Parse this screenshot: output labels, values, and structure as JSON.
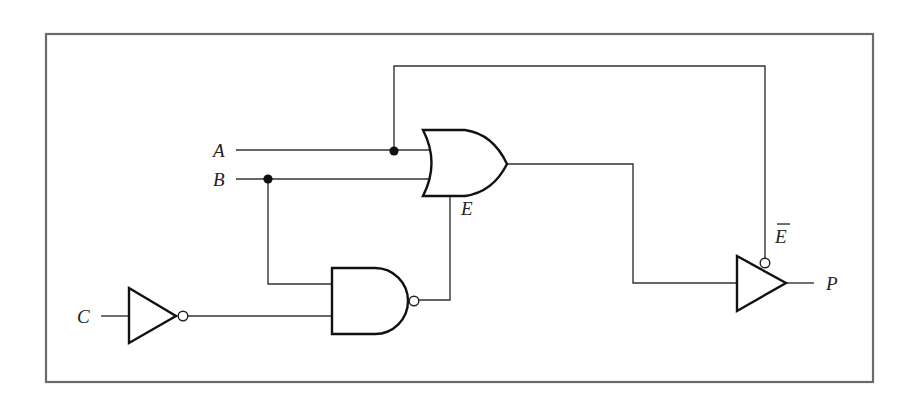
{
  "diagram": {
    "type": "logic-circuit",
    "frame_color": "#6b6b6b",
    "wire_color": "#333333",
    "gate_stroke_color": "#111111",
    "labels": {
      "input_a": "A",
      "input_b": "B",
      "input_c": "C",
      "or_output": "E",
      "enable_bar": "E",
      "output": "P"
    },
    "gates": [
      {
        "id": "not-c",
        "type": "NOT",
        "inputs": [
          "C"
        ],
        "output": "C'"
      },
      {
        "id": "nand-1",
        "type": "NAND",
        "inputs": [
          "B",
          "C'"
        ],
        "output": "nand_out"
      },
      {
        "id": "or-1",
        "type": "OR",
        "inputs": [
          "A",
          "B",
          "nand_out"
        ],
        "output": "E"
      },
      {
        "id": "tristate-1",
        "type": "TRI-STATE BUFFER (active-low enable)",
        "inputs": [
          "E"
        ],
        "enable": "E-bar (from A)",
        "output": "P"
      }
    ],
    "junctions": [
      "A tap to enable line",
      "B tap to NAND input"
    ]
  }
}
